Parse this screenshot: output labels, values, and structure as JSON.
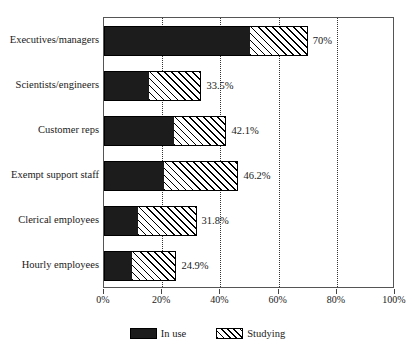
{
  "chart_data": {
    "type": "bar",
    "orientation": "horizontal",
    "stacked": true,
    "title": "",
    "xlabel": "",
    "ylabel": "",
    "xlim": [
      0,
      100
    ],
    "grid": true,
    "legend_position": "bottom-center",
    "categories": [
      "Executives/managers",
      "Scientists/engineers",
      "Customer reps",
      "Exempt support staff",
      "Clerical employees",
      "Hourly employees"
    ],
    "series": [
      {
        "name": "In use",
        "values": [
          50.0,
          15.5,
          24.0,
          20.6,
          11.7,
          9.6
        ]
      },
      {
        "name": "Studying",
        "values": [
          20.0,
          18.0,
          18.1,
          25.6,
          20.1,
          15.3
        ]
      }
    ],
    "totals": [
      70.0,
      33.5,
      42.1,
      46.2,
      31.8,
      24.9
    ],
    "total_labels": [
      "70%",
      "33.5%",
      "42.1%",
      "46.2%",
      "31.8%",
      "24.9%"
    ],
    "xticks": [
      0,
      20,
      40,
      60,
      80,
      100
    ],
    "xticklabels": [
      "0%",
      "20%",
      "40%",
      "60%",
      "80%",
      "100%"
    ]
  },
  "legend": {
    "entries": [
      {
        "label": "In use",
        "swatch": "solid-black",
        "color": "#1c1c1c"
      },
      {
        "label": "Studying",
        "swatch": "diagonal-hatch",
        "color": "#000000"
      }
    ]
  },
  "title_remnant": ""
}
